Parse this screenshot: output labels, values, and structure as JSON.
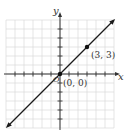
{
  "chart_data": {
    "type": "line",
    "title": "",
    "xlabel": "x",
    "ylabel": "y",
    "xlim": [
      -6,
      6
    ],
    "ylim": [
      -6,
      6
    ],
    "grid": true,
    "tick_spacing": 1,
    "series": [
      {
        "name": "y = x",
        "x": [
          -6,
          6
        ],
        "y": [
          -6,
          6
        ],
        "arrows_both_ends": true
      }
    ],
    "points": [
      {
        "x": 0,
        "y": 0,
        "label": "(0, 0)"
      },
      {
        "x": 3,
        "y": 3,
        "label": "(3, 3)"
      }
    ],
    "origin_label": "O"
  },
  "colors": {
    "grid": "#d4d4d4",
    "axis": "#333333",
    "line": "#1a1a1a",
    "point": "#111111",
    "text": "#333333"
  }
}
